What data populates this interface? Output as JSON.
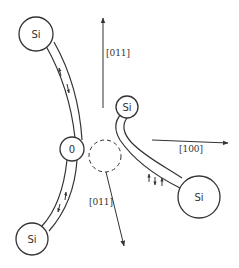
{
  "diagram": {
    "type": "crystal-structure-schematic",
    "atoms": [
      {
        "id": "si-top-left",
        "label": "Si",
        "cx": 36,
        "cy": 34,
        "r": 17
      },
      {
        "id": "o-center",
        "label": "0",
        "cx": 72,
        "cy": 149,
        "r": 12
      },
      {
        "id": "si-bottom-left",
        "label": "Si",
        "cx": 32,
        "cy": 239,
        "r": 16
      },
      {
        "id": "si-small",
        "label": "Si",
        "cx": 127,
        "cy": 107,
        "r": 11
      },
      {
        "id": "si-bottom-right",
        "label": "Si",
        "cx": 199,
        "cy": 197,
        "r": 21
      }
    ],
    "vacancy": {
      "cx": 105,
      "cy": 156,
      "r": 16,
      "style": "dashed"
    },
    "directions": [
      {
        "id": "dir-top",
        "label": "[011]"
      },
      {
        "id": "dir-right",
        "label": "[100]"
      },
      {
        "id": "dir-bottom",
        "label": "[011]"
      }
    ],
    "bond_spin_arrows": {
      "upper_left_bond": [
        "up",
        "down"
      ],
      "lower_left_bond": [
        "up",
        "down"
      ],
      "right_bond": [
        "up",
        "down",
        "up"
      ]
    },
    "colors": {
      "stroke": "#333333",
      "background": "#ffffff"
    }
  }
}
